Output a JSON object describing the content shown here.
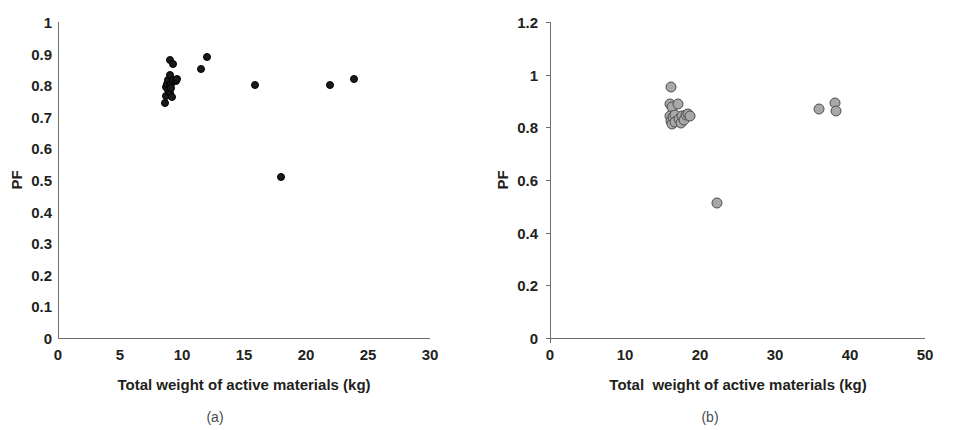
{
  "figure": {
    "panels": [
      {
        "id": "a",
        "caption": "(a)",
        "chart_data": {
          "type": "scatter",
          "title": "",
          "xlabel": "Total weight of active materials (kg)",
          "ylabel": "PF",
          "xlim": [
            0,
            30
          ],
          "ylim": [
            0,
            1
          ],
          "xticks": [
            0,
            5,
            10,
            15,
            20,
            25,
            30
          ],
          "yticks": [
            0,
            0.1,
            0.2,
            0.3,
            0.4,
            0.5,
            0.6,
            0.7,
            0.8,
            0.9,
            1
          ],
          "xtick_labels": [
            "0",
            "5",
            "10",
            "15",
            "20",
            "25",
            "30"
          ],
          "ytick_labels": [
            "0",
            "0.1",
            "0.2",
            "0.3",
            "0.4",
            "0.5",
            "0.6",
            "0.7",
            "0.8",
            "0.9",
            "1"
          ],
          "grid": false,
          "legend": "none",
          "marker": "filled-circle",
          "marker_color": "#1a1a1a",
          "points": [
            {
              "x": 8.6,
              "y": 0.745
            },
            {
              "x": 8.7,
              "y": 0.765
            },
            {
              "x": 8.7,
              "y": 0.795
            },
            {
              "x": 8.8,
              "y": 0.805
            },
            {
              "x": 8.9,
              "y": 0.785
            },
            {
              "x": 8.9,
              "y": 0.815
            },
            {
              "x": 9.0,
              "y": 0.8
            },
            {
              "x": 9.0,
              "y": 0.832
            },
            {
              "x": 9.05,
              "y": 0.775
            },
            {
              "x": 9.1,
              "y": 0.805
            },
            {
              "x": 9.15,
              "y": 0.79
            },
            {
              "x": 9.2,
              "y": 0.762
            },
            {
              "x": 9.25,
              "y": 0.818
            },
            {
              "x": 9.0,
              "y": 0.88
            },
            {
              "x": 9.3,
              "y": 0.866
            },
            {
              "x": 9.5,
              "y": 0.812
            },
            {
              "x": 9.6,
              "y": 0.82
            },
            {
              "x": 11.5,
              "y": 0.85
            },
            {
              "x": 12.0,
              "y": 0.888
            },
            {
              "x": 15.9,
              "y": 0.8
            },
            {
              "x": 18.0,
              "y": 0.51
            },
            {
              "x": 21.9,
              "y": 0.8
            },
            {
              "x": 23.9,
              "y": 0.82
            }
          ]
        }
      },
      {
        "id": "b",
        "caption": "(b)",
        "chart_data": {
          "type": "scatter",
          "title": "",
          "xlabel": "Total  weight of active materials (kg)",
          "ylabel": "PF",
          "xlim": [
            0,
            50
          ],
          "ylim": [
            0,
            1.2
          ],
          "xticks": [
            0,
            10,
            20,
            30,
            40,
            50
          ],
          "yticks": [
            0,
            0.2,
            0.4,
            0.6,
            0.8,
            1,
            1.2
          ],
          "xtick_labels": [
            "0",
            "10",
            "20",
            "30",
            "40",
            "50"
          ],
          "ytick_labels": [
            "0",
            "0.2",
            "0.4",
            "0.6",
            "0.8",
            "1",
            "1.2"
          ],
          "grid": false,
          "legend": "none",
          "marker": "open-circle",
          "marker_fill": "#a8a8a8",
          "marker_edge": "#4d4d4d",
          "points": [
            {
              "x": 16.1,
              "y": 0.955
            },
            {
              "x": 16.0,
              "y": 0.89
            },
            {
              "x": 16.2,
              "y": 0.878
            },
            {
              "x": 17.0,
              "y": 0.89
            },
            {
              "x": 16.0,
              "y": 0.843
            },
            {
              "x": 16.1,
              "y": 0.825
            },
            {
              "x": 16.3,
              "y": 0.812
            },
            {
              "x": 16.4,
              "y": 0.838
            },
            {
              "x": 16.6,
              "y": 0.848
            },
            {
              "x": 16.7,
              "y": 0.82
            },
            {
              "x": 17.2,
              "y": 0.832
            },
            {
              "x": 17.4,
              "y": 0.815
            },
            {
              "x": 17.6,
              "y": 0.842
            },
            {
              "x": 17.9,
              "y": 0.828
            },
            {
              "x": 18.1,
              "y": 0.845
            },
            {
              "x": 18.4,
              "y": 0.85
            },
            {
              "x": 18.7,
              "y": 0.843
            },
            {
              "x": 22.3,
              "y": 0.512
            },
            {
              "x": 35.9,
              "y": 0.87
            },
            {
              "x": 38.0,
              "y": 0.893
            },
            {
              "x": 38.1,
              "y": 0.862
            }
          ]
        }
      }
    ]
  }
}
